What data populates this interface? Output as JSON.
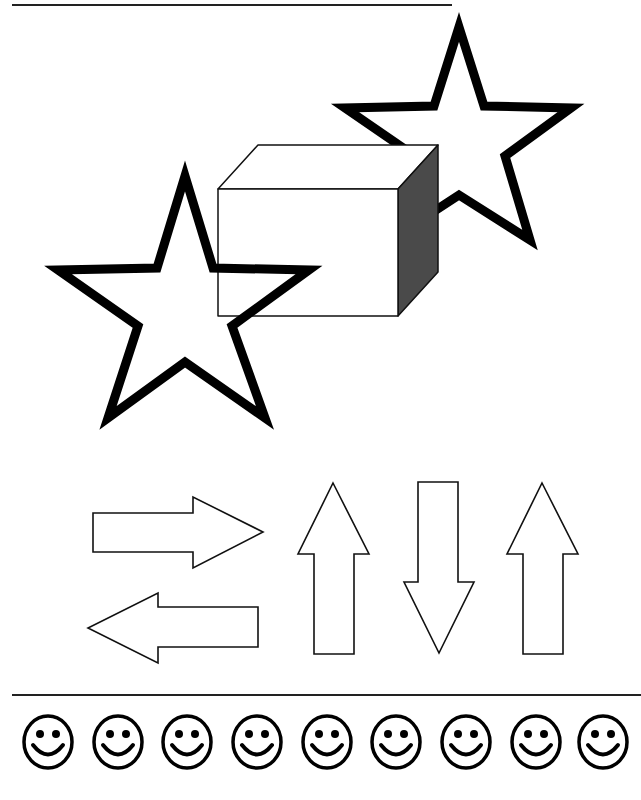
{
  "page": {
    "background": "#ffffff",
    "ink": "#111111",
    "shade": "#4a4a4a"
  },
  "top_rule": {
    "x1": 12,
    "y1": 5,
    "x2": 452,
    "y2": 5
  },
  "stars": [
    {
      "name": "star-large-left",
      "points": "185,176 213,268 309,270 232,326 265,418 185,362 108,418 138,326 58,270 157,268"
    },
    {
      "name": "star-upper-right",
      "points": "459,27 484,106 571,108 505,156 530,240 459,195 390,240 415,156 345,108 434,106"
    }
  ],
  "box": {
    "front": "218,189 398,189 398,316 218,316",
    "top": "218,189 258,145 438,145 398,189",
    "side": "398,189 438,145 438,272 398,316"
  },
  "arrows": [
    {
      "name": "arrow-right",
      "points": "93,513 193,513 193,497 263,532 193,568 193,552 93,552"
    },
    {
      "name": "arrow-left",
      "points": "258,607 158,607 158,593 88,628 158,663 158,647 258,647"
    },
    {
      "name": "arrow-up-1",
      "points": "333,483 369,554 354,554 354,654 314,654 314,554 298,554"
    },
    {
      "name": "arrow-down",
      "points": "418,482 458,482 458,582 474,582 439,653 404,582 418,582"
    },
    {
      "name": "arrow-up-2",
      "points": "542,483 578,554 563,554 563,654 523,654 523,554 507,554"
    }
  ],
  "bottom_rule": {
    "x1": 12,
    "y1": 695,
    "x2": 641,
    "y2": 695
  },
  "smileys": {
    "cy": 742,
    "rx": 24,
    "ry": 26,
    "centers": [
      48,
      118,
      187,
      257,
      327,
      396,
      466,
      536,
      603
    ]
  }
}
